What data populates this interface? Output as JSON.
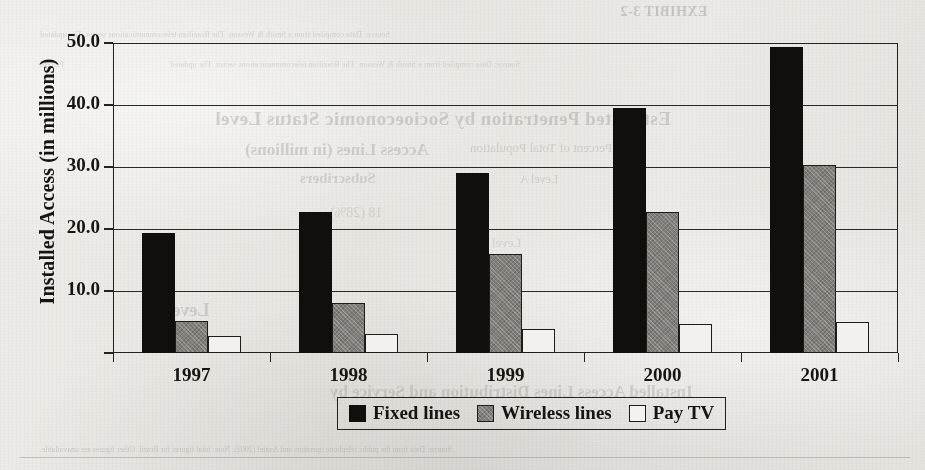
{
  "chart_data": {
    "type": "bar",
    "title": "",
    "xlabel": "",
    "ylabel": "Installed Access (in millions)",
    "categories": [
      "1997",
      "1998",
      "1999",
      "2000",
      "2001"
    ],
    "series": [
      {
        "name": "Fixed lines",
        "color": "#100f0c",
        "values": [
          19.0,
          22.4,
          28.7,
          39.2,
          49.0
        ]
      },
      {
        "name": "Wireless lines",
        "color": "#807e78",
        "values": [
          4.8,
          7.8,
          15.6,
          22.4,
          30.0
        ]
      },
      {
        "name": "Pay TV",
        "color": "#f2f1ed",
        "values": [
          2.5,
          2.8,
          3.6,
          4.3,
          4.6
        ]
      }
    ],
    "ylim": [
      0,
      50
    ],
    "ytick_values": [
      10,
      20,
      30,
      40,
      50
    ],
    "ytick_labels": [
      "10.0",
      "20.0",
      "30.0",
      "40.0",
      "50.0"
    ],
    "grid": true,
    "legend_position": "bottom-center"
  },
  "legend": {
    "items": [
      {
        "label": "Fixed lines"
      },
      {
        "label": "Wireless lines"
      },
      {
        "label": "Pay TV"
      }
    ]
  },
  "background_bleed": {
    "line1": "EXHIBIT 3-2",
    "line2": "Source: Data compiled from a Smith & Wesson. The Brazilian telecommunications sector. The updated",
    "line3": "Estimated Penetration by Socioeconomic Status Level",
    "line4": "Access Lines (in millions)",
    "line5": "Subscribers",
    "line6": "Percent of Total Population",
    "line7": "Level A",
    "line8": "18 (28%)",
    "line9": "Level B",
    "line10": "22.4",
    "line11": "Level C",
    "line12": "Percent of Installed Access Lines and Penetration by Access Speed (2001)",
    "line13": "Percent",
    "line14": "Installed Access Lines Distribution and Service by",
    "line15": "Source: Data from the public telephone operators and Anatel (2002). Note: total figures for Brazil. Other figures are unavailable."
  }
}
